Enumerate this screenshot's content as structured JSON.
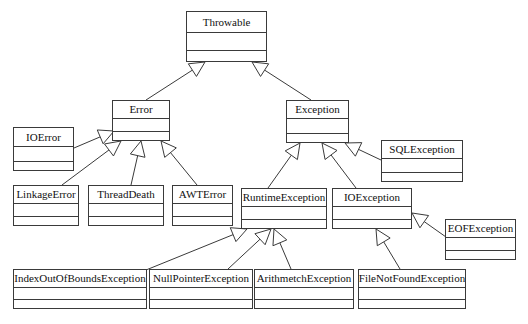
{
  "diagram": {
    "kind": "uml-class-diagram",
    "background_color": "#ffffff",
    "line_color": "#3a3a3a",
    "text_color": "#111111",
    "relationship_label": "generalization",
    "classes": [
      {
        "id": "throwable",
        "name": "Throwable",
        "x": 186,
        "y": 11,
        "w": 81,
        "h": 51,
        "name_h": 21,
        "ops_h": 10,
        "font_size": 11
      },
      {
        "id": "error",
        "name": "Error",
        "x": 112,
        "y": 100,
        "w": 58,
        "h": 41,
        "name_h": 18,
        "ops_h": 8,
        "font_size": 11
      },
      {
        "id": "exception",
        "name": "Exception",
        "x": 286,
        "y": 100,
        "w": 63,
        "h": 43,
        "name_h": 18,
        "ops_h": 8,
        "font_size": 11
      },
      {
        "id": "ioerror",
        "name": "IOError",
        "x": 13,
        "y": 127,
        "w": 61,
        "h": 44,
        "name_h": 19,
        "ops_h": 8,
        "font_size": 11
      },
      {
        "id": "sqlexception",
        "name": "SQLException",
        "x": 381,
        "y": 140,
        "w": 82,
        "h": 42,
        "name_h": 18,
        "ops_h": 8,
        "font_size": 11
      },
      {
        "id": "linkageerror",
        "name": "LinkageError",
        "x": 13,
        "y": 185,
        "w": 66,
        "h": 41,
        "name_h": 18,
        "ops_h": 8,
        "font_size": 11
      },
      {
        "id": "threaddeath",
        "name": "ThreadDeath",
        "x": 88,
        "y": 185,
        "w": 76,
        "h": 41,
        "name_h": 18,
        "ops_h": 8,
        "font_size": 11
      },
      {
        "id": "awterror",
        "name": "AWTError",
        "x": 172,
        "y": 185,
        "w": 61,
        "h": 41,
        "name_h": 18,
        "ops_h": 8,
        "font_size": 11
      },
      {
        "id": "runtimeexception",
        "name": "RuntimeException",
        "x": 241,
        "y": 188,
        "w": 86,
        "h": 41,
        "name_h": 18,
        "ops_h": 8,
        "font_size": 11
      },
      {
        "id": "ioexception",
        "name": "IOException",
        "x": 332,
        "y": 188,
        "w": 80,
        "h": 41,
        "name_h": 18,
        "ops_h": 8,
        "font_size": 11
      },
      {
        "id": "eofexception",
        "name": "EOFException",
        "x": 445,
        "y": 219,
        "w": 71,
        "h": 41,
        "name_h": 18,
        "ops_h": 8,
        "font_size": 11
      },
      {
        "id": "indexoutofboundsexception",
        "name": "IndexOutOfBoundsException",
        "x": 13,
        "y": 269,
        "w": 134,
        "h": 40,
        "name_h": 18,
        "ops_h": 8,
        "font_size": 11
      },
      {
        "id": "nullpointerexception",
        "name": "NullPointerException",
        "x": 149,
        "y": 269,
        "w": 104,
        "h": 40,
        "name_h": 18,
        "ops_h": 8,
        "font_size": 11
      },
      {
        "id": "arithmetchexception",
        "name": "ArithmetchException",
        "x": 254,
        "y": 269,
        "w": 100,
        "h": 40,
        "name_h": 18,
        "ops_h": 8,
        "font_size": 11
      },
      {
        "id": "filenotfoundexception",
        "name": "FileNotFoundException",
        "x": 358,
        "y": 269,
        "w": 108,
        "h": 40,
        "name_h": 18,
        "ops_h": 8,
        "font_size": 11
      }
    ],
    "generalizations": [
      {
        "id": "error-to-throwable",
        "child": "error",
        "parent": "throwable"
      },
      {
        "id": "exception-to-throwable",
        "child": "exception",
        "parent": "throwable"
      },
      {
        "id": "ioerror-to-error",
        "child": "ioerror",
        "parent": "error"
      },
      {
        "id": "linkageerror-to-error",
        "child": "linkageerror",
        "parent": "error"
      },
      {
        "id": "threaddeath-to-error",
        "child": "threaddeath",
        "parent": "error"
      },
      {
        "id": "awterror-to-error",
        "child": "awterror",
        "parent": "error"
      },
      {
        "id": "runtimeexception-to-exception",
        "child": "runtimeexception",
        "parent": "exception"
      },
      {
        "id": "ioexception-to-exception",
        "child": "ioexception",
        "parent": "exception"
      },
      {
        "id": "sqlexception-to-exception",
        "child": "sqlexception",
        "parent": "exception"
      },
      {
        "id": "ioobe-to-runtimeexception",
        "child": "indexoutofboundsexception",
        "parent": "runtimeexception"
      },
      {
        "id": "npe-to-runtimeexception",
        "child": "nullpointerexception",
        "parent": "runtimeexception"
      },
      {
        "id": "arith-to-runtimeexception",
        "child": "arithmetchexception",
        "parent": "runtimeexception"
      },
      {
        "id": "fnfe-to-ioexception",
        "child": "filenotfoundexception",
        "parent": "ioexception"
      },
      {
        "id": "eofe-to-ioexception",
        "child": "eofexception",
        "parent": "ioexception"
      }
    ],
    "edge_geometry": {
      "error-to-throwable": {
        "from": [
          146,
          100
        ],
        "to": [
          205,
          62
        ],
        "head": "up"
      },
      "exception-to-throwable": {
        "from": [
          311,
          100
        ],
        "to": [
          252,
          62
        ],
        "head": "up"
      },
      "ioerror-to-error": {
        "from": [
          74,
          148
        ],
        "to": [
          114,
          131
        ],
        "head": "upright"
      },
      "linkageerror-to-error": {
        "from": [
          62,
          185
        ],
        "to": [
          121,
          141
        ],
        "head": "up"
      },
      "threaddeath-to-error": {
        "from": [
          131,
          185
        ],
        "to": [
          141,
          141
        ],
        "head": "up"
      },
      "awterror-to-error": {
        "from": [
          197,
          185
        ],
        "to": [
          161,
          141
        ],
        "head": "up"
      },
      "runtimeexception-to-exception": {
        "from": [
          268,
          188
        ],
        "to": [
          300,
          143
        ],
        "head": "up"
      },
      "ioexception-to-exception": {
        "from": [
          356,
          188
        ],
        "to": [
          322,
          143
        ],
        "head": "up"
      },
      "sqlexception-to-exception": {
        "from": [
          381,
          160
        ],
        "to": [
          345,
          143
        ],
        "head": "upright"
      },
      "ioobe-to-runtimeexception": {
        "from": [
          146,
          270
        ],
        "to": [
          247,
          229
        ],
        "head": "upright"
      },
      "npe-to-runtimeexception": {
        "from": [
          228,
          269
        ],
        "to": [
          271,
          229
        ],
        "head": "up"
      },
      "arith-to-runtimeexception": {
        "from": [
          291,
          269
        ],
        "to": [
          274,
          229
        ],
        "head": "up"
      },
      "fnfe-to-ioexception": {
        "from": [
          400,
          269
        ],
        "to": [
          376,
          229
        ],
        "head": "up"
      },
      "eofe-to-ioexception": {
        "from": [
          446,
          237
        ],
        "to": [
          412,
          213
        ],
        "head": "upright"
      }
    }
  }
}
